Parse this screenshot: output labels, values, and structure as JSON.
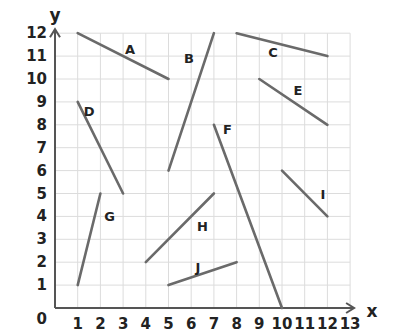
{
  "diagram": {
    "type": "coordinate-grid-line-segments",
    "axes": {
      "x_label": "x",
      "y_label": "y",
      "origin_label": "0",
      "x_ticks": [
        "1",
        "2",
        "3",
        "4",
        "5",
        "6",
        "7",
        "8",
        "9",
        "10",
        "11",
        "12",
        "13"
      ],
      "y_ticks": [
        "1",
        "2",
        "3",
        "4",
        "5",
        "6",
        "7",
        "8",
        "9",
        "10",
        "11",
        "12"
      ],
      "x_range": [
        0,
        13
      ],
      "y_range": [
        0,
        12
      ],
      "grid": true
    },
    "segments": [
      {
        "label": "A",
        "from": [
          1,
          12
        ],
        "to": [
          5,
          10
        ],
        "label_pos": [
          3.3,
          11.3
        ]
      },
      {
        "label": "B",
        "from": [
          5,
          6
        ],
        "to": [
          7,
          12
        ],
        "label_pos": [
          5.9,
          10.9
        ]
      },
      {
        "label": "C",
        "from": [
          8,
          12
        ],
        "to": [
          12,
          11
        ],
        "label_pos": [
          9.6,
          11.2
        ]
      },
      {
        "label": "D",
        "from": [
          1,
          9
        ],
        "to": [
          3,
          5
        ],
        "label_pos": [
          1.5,
          8.6
        ]
      },
      {
        "label": "E",
        "from": [
          9,
          10
        ],
        "to": [
          12,
          8
        ],
        "label_pos": [
          10.7,
          9.5
        ]
      },
      {
        "label": "F",
        "from": [
          7,
          8
        ],
        "to": [
          10,
          0
        ],
        "label_pos": [
          7.6,
          7.8
        ]
      },
      {
        "label": "G",
        "from": [
          1,
          1
        ],
        "to": [
          2,
          5
        ],
        "label_pos": [
          2.4,
          4.0
        ]
      },
      {
        "label": "H",
        "from": [
          4,
          2
        ],
        "to": [
          7,
          5
        ],
        "label_pos": [
          6.5,
          3.6
        ]
      },
      {
        "label": "I",
        "from": [
          10,
          6
        ],
        "to": [
          12,
          4
        ],
        "label_pos": [
          11.8,
          5.0
        ]
      },
      {
        "label": "J",
        "from": [
          5,
          1
        ],
        "to": [
          8,
          2
        ],
        "label_pos": [
          6.3,
          1.8
        ]
      }
    ]
  }
}
